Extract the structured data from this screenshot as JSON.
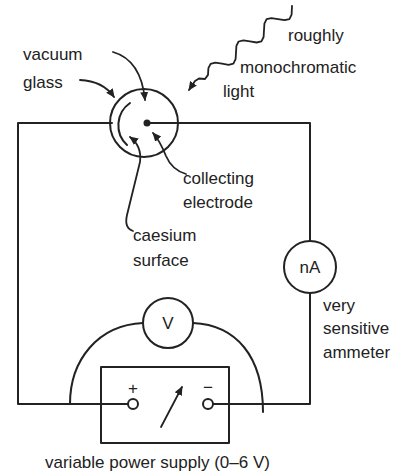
{
  "diagram": {
    "colors": {
      "line": "#222222",
      "background": "#ffffff"
    },
    "labels": {
      "vacuum": "vacuum",
      "glass": "glass",
      "light_line1": "roughly",
      "light_line2": "monochromatic",
      "light_line3": "light",
      "collecting_line1": "collecting",
      "collecting_line2": "electrode",
      "caesium_line1": "caesium",
      "caesium_line2": "surface",
      "ammeter_line1": "very",
      "ammeter_line2": "sensitive",
      "ammeter_line3": "ammeter",
      "power_supply": "variable power supply (0–6 V)"
    },
    "components": {
      "ammeter_symbol": "nA",
      "voltmeter_symbol": "V",
      "positive_terminal": "+",
      "negative_terminal": "−"
    }
  }
}
